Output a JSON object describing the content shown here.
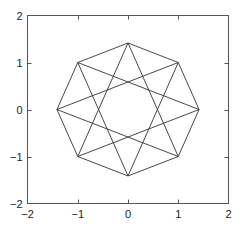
{
  "chart_data": {
    "type": "line",
    "title": "",
    "xlabel": "",
    "ylabel": "",
    "xlim": [
      -2,
      2
    ],
    "ylim": [
      -2,
      2
    ],
    "grid": false,
    "legend": null,
    "x_ticks": [
      -2,
      -1,
      0,
      1,
      2
    ],
    "y_ticks": [
      -2,
      -1,
      0,
      1,
      2
    ],
    "x_tick_labels": [
      "−2",
      "−1",
      "0",
      "1",
      "2"
    ],
    "y_tick_labels": [
      "−2",
      "−1",
      "0",
      "1",
      "2"
    ],
    "vertices": [
      {
        "x": 1.414,
        "y": 0
      },
      {
        "x": 1,
        "y": 1
      },
      {
        "x": 0,
        "y": 1.414
      },
      {
        "x": -1,
        "y": 1
      },
      {
        "x": -1.414,
        "y": 0
      },
      {
        "x": -1,
        "y": -1
      },
      {
        "x": 0,
        "y": -1.414
      },
      {
        "x": 1,
        "y": -1
      }
    ],
    "series": [
      {
        "name": "octagon",
        "connect_step": 1
      },
      {
        "name": "star",
        "connect_step": 3
      }
    ],
    "line_color": "#333333"
  }
}
